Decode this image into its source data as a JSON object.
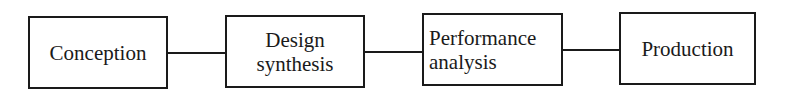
{
  "diagram": {
    "type": "flowchart",
    "direction": "left-to-right",
    "nodes": [
      {
        "id": "conception",
        "lines": [
          "Conception"
        ]
      },
      {
        "id": "design-synthesis",
        "lines": [
          "Design",
          "synthesis"
        ]
      },
      {
        "id": "performance-analysis",
        "lines": [
          "Performance",
          "analysis"
        ]
      },
      {
        "id": "production",
        "lines": [
          "Production"
        ]
      }
    ],
    "edges": [
      {
        "from": "conception",
        "to": "design-synthesis"
      },
      {
        "from": "design-synthesis",
        "to": "performance-analysis"
      },
      {
        "from": "performance-analysis",
        "to": "production"
      }
    ],
    "colors": {
      "stroke": "#1a1a1a",
      "background": "#ffffff",
      "text": "#1a1a1a"
    }
  }
}
